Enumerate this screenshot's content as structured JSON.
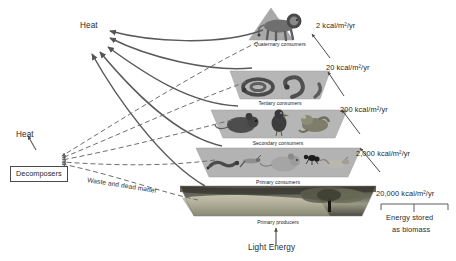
{
  "diagram": {
    "type": "energy-pyramid"
  },
  "trophic_levels": [
    {
      "id": "quaternary",
      "name": "Quaternary consumers",
      "energy": "2 kcal/m²/yr",
      "organisms": [
        "lion"
      ]
    },
    {
      "id": "tertiary",
      "name": "Tertiary consumers",
      "energy": "20 kcal/m²/yr",
      "organisms": [
        "snake",
        "snake"
      ]
    },
    {
      "id": "secondary",
      "name": "Secondary consumers",
      "energy": "200 kcal/m²/yr",
      "organisms": [
        "mouse",
        "bird",
        "frog"
      ]
    },
    {
      "id": "primary_consumers",
      "name": "Primary consumers",
      "energy": "2,000 kcal/m²/yr",
      "organisms": [
        "caterpillar",
        "grasshopper",
        "mouse",
        "ant",
        "grasshopper"
      ]
    },
    {
      "id": "primary_producers",
      "name": "Primary producers",
      "energy": "20,000 kcal/m²/yr",
      "organisms": [
        "grassland",
        "tree"
      ]
    }
  ],
  "annotations": {
    "heat_top": "Heat",
    "heat_left": "Heat",
    "decomposers": "Decomposers",
    "waste": "Waste and dead matter",
    "light_energy": "Light Energy",
    "biomass_line1": "Energy stored",
    "biomass_line2": "as biomass"
  },
  "colors": {
    "slab": "#b9b9b9",
    "slab_edge": "#9a9a9a",
    "arrow": "#555555",
    "dashed": "#6e6e6e",
    "text": "#231f20",
    "base_dark": "#3a3a33"
  }
}
